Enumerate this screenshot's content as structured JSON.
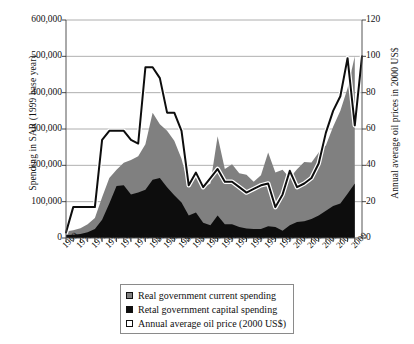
{
  "chart_data": {
    "type": "area",
    "title": "",
    "xlabel": "",
    "ylabel": "Spending in SAR (1999 base year)",
    "y2label": "Annual average oil prices in 2000 US$",
    "grid": true,
    "legend_position": "bottom",
    "xlim": [
      1969,
      2010
    ],
    "ylim": [
      0,
      600000
    ],
    "y2lim": [
      0,
      120
    ],
    "ytick_labels": [
      "600,000",
      "500,000",
      "400,000",
      "300,000",
      "200,000",
      "100,000",
      "0"
    ],
    "ytick_values": [
      600000,
      500000,
      400000,
      300000,
      200000,
      100000,
      0
    ],
    "y2tick_labels": [
      "120",
      "100",
      "80",
      "60",
      "40",
      "20",
      "0"
    ],
    "y2tick_values": [
      120,
      100,
      80,
      60,
      40,
      20,
      0
    ],
    "xtick_labels": [
      "1969",
      "1971",
      "1973",
      "1975",
      "1977",
      "1979",
      "1981",
      "1983",
      "1985",
      "1987",
      "1989",
      "1991",
      "1993",
      "1995",
      "1997",
      "1999",
      "2001",
      "2003",
      "2005",
      "2007",
      "2009"
    ],
    "x": [
      1969,
      1970,
      1971,
      1972,
      1973,
      1974,
      1975,
      1976,
      1977,
      1978,
      1979,
      1980,
      1981,
      1982,
      1983,
      1984,
      1985,
      1986,
      1987,
      1988,
      1989,
      1990,
      1991,
      1992,
      1993,
      1994,
      1995,
      1996,
      1997,
      1998,
      1999,
      2000,
      2001,
      2002,
      2003,
      2004,
      2005,
      2006,
      2007,
      2008,
      2009
    ],
    "series": [
      {
        "name": "Retal government capital spending",
        "axis": "left",
        "color": "#0d0d0d",
        "stacked": true,
        "values": [
          8000,
          9000,
          11000,
          16000,
          25000,
          50000,
          95000,
          143000,
          145000,
          120000,
          125000,
          133000,
          160000,
          165000,
          140000,
          118000,
          98000,
          62000,
          70000,
          42000,
          35000,
          62000,
          38000,
          38000,
          30000,
          26000,
          25000,
          25000,
          32000,
          30000,
          20000,
          35000,
          44000,
          46000,
          52000,
          62000,
          75000,
          88000,
          95000,
          122000,
          150000
        ]
      },
      {
        "name": "Real government current spending",
        "axis": "left",
        "color": "#808080",
        "stacked": true,
        "values": [
          10000,
          12000,
          16000,
          22000,
          30000,
          62000,
          70000,
          45000,
          62000,
          95000,
          100000,
          125000,
          185000,
          148000,
          155000,
          150000,
          120000,
          82000,
          112000,
          97000,
          115000,
          218000,
          152000,
          165000,
          148000,
          148000,
          130000,
          148000,
          203000,
          150000,
          168000,
          130000,
          145000,
          163000,
          156000,
          173000,
          180000,
          218000,
          255000,
          290000,
          350000
        ]
      },
      {
        "name": "Annual average oil price (2000 US$)",
        "axis": "right",
        "color": "#0d0d0d",
        "line": true,
        "values": [
          3,
          17,
          17,
          17,
          17,
          54,
          59,
          59,
          59,
          54,
          52,
          94,
          94,
          88,
          69,
          69,
          59,
          29,
          36,
          28,
          33,
          38,
          31,
          31,
          28,
          25,
          27,
          29,
          30,
          17,
          24,
          37,
          28,
          30,
          33,
          41,
          58,
          70,
          78,
          99,
          62
        ]
      }
    ]
  },
  "legend": {
    "items": [
      {
        "label": "Real government current spending",
        "swatch": "#808080",
        "swatch_name": "gray-square"
      },
      {
        "label": "Retal government capital spending",
        "swatch": "#0d0d0d",
        "swatch_name": "black-square"
      },
      {
        "label": "Annual average oil price (2000 US$)",
        "swatch": "#ffffff",
        "swatch_name": "white-square"
      }
    ]
  }
}
